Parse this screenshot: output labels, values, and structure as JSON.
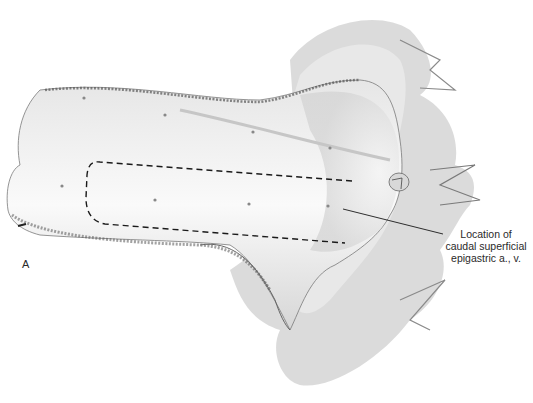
{
  "figure": {
    "panel_letter": "A",
    "callout": {
      "line1": "Location of",
      "line2": "caudal superficial",
      "line3": "epigastric a., v."
    },
    "colors": {
      "ink": "#2a2a2a",
      "fur": "#6e6e6e",
      "skin_shade": "#d8d8d8",
      "background": "#ffffff"
    }
  }
}
